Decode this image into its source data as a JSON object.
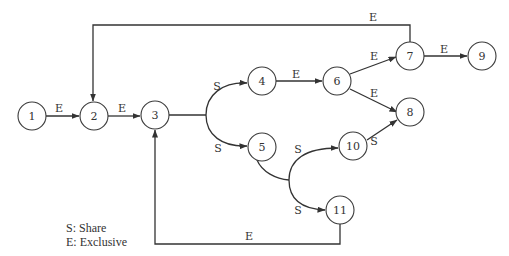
{
  "diagram": {
    "type": "lock-request precedence graph",
    "colors": {
      "stroke": "#333333",
      "node_fill": "#ffffff",
      "text": "#333333"
    },
    "nodes": [
      {
        "id": "1",
        "label": "1",
        "x": 32,
        "y": 116
      },
      {
        "id": "2",
        "label": "2",
        "x": 94,
        "y": 116
      },
      {
        "id": "3",
        "label": "3",
        "x": 155,
        "y": 115
      },
      {
        "id": "4",
        "label": "4",
        "x": 262,
        "y": 81
      },
      {
        "id": "5",
        "label": "5",
        "x": 262,
        "y": 147
      },
      {
        "id": "6",
        "label": "6",
        "x": 337,
        "y": 81
      },
      {
        "id": "7",
        "label": "7",
        "x": 410,
        "y": 56
      },
      {
        "id": "8",
        "label": "8",
        "x": 410,
        "y": 112
      },
      {
        "id": "9",
        "label": "9",
        "x": 482,
        "y": 56
      },
      {
        "id": "10",
        "label": "10",
        "x": 353,
        "y": 146
      },
      {
        "id": "11",
        "label": "11",
        "x": 340,
        "y": 210
      }
    ],
    "edges": [
      {
        "from": "1",
        "to": "2",
        "label": "E"
      },
      {
        "from": "2",
        "to": "3",
        "label": "E"
      },
      {
        "from": "3",
        "to": "4",
        "label": "S"
      },
      {
        "from": "3",
        "to": "5",
        "label": "S"
      },
      {
        "from": "4",
        "to": "6",
        "label": "E"
      },
      {
        "from": "6",
        "to": "7",
        "label": "E"
      },
      {
        "from": "6",
        "to": "8",
        "label": "E"
      },
      {
        "from": "7",
        "to": "9",
        "label": "E"
      },
      {
        "from": "7",
        "to": "2",
        "label": "E"
      },
      {
        "from": "5",
        "to": "10",
        "label": "S"
      },
      {
        "from": "5",
        "to": "11",
        "label": "S"
      },
      {
        "from": "10",
        "to": "8",
        "label": "S"
      },
      {
        "from": "11",
        "to": "3",
        "label": "E"
      }
    ],
    "legend": {
      "share": "S: Share",
      "exclusive": "E: Exclusive"
    }
  }
}
